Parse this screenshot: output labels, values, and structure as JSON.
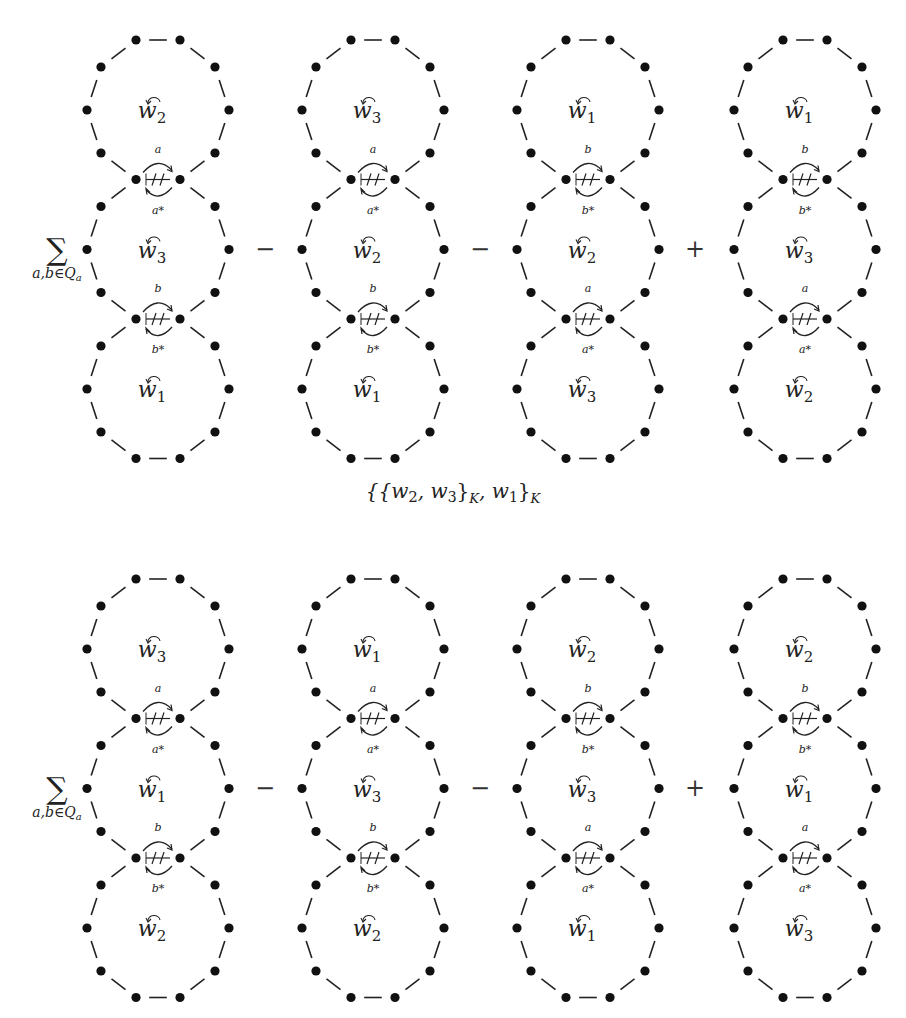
{
  "rows": [
    {
      "prefix": {
        "sum_symbol": "∑",
        "sum_subscript": "a,b∈Q",
        "sum_subscript_sub": "a"
      },
      "operators": [
        "−",
        "−",
        "+"
      ],
      "diagrams": [
        {
          "loops": [
            "2",
            "3",
            "1"
          ],
          "crossings": [
            {
              "top": "a",
              "bottom": "a*"
            },
            {
              "top": "b",
              "bottom": "b*"
            }
          ]
        },
        {
          "loops": [
            "3",
            "2",
            "1"
          ],
          "crossings": [
            {
              "top": "a",
              "bottom": "a*"
            },
            {
              "top": "b",
              "bottom": "b*"
            }
          ]
        },
        {
          "loops": [
            "1",
            "2",
            "3"
          ],
          "crossings": [
            {
              "top": "b",
              "bottom": "b*"
            },
            {
              "top": "a",
              "bottom": "a*"
            }
          ]
        },
        {
          "loops": [
            "1",
            "3",
            "2"
          ],
          "crossings": [
            {
              "top": "b",
              "bottom": "b*"
            },
            {
              "top": "a",
              "bottom": "a*"
            }
          ]
        }
      ]
    },
    {
      "prefix": {
        "sum_symbol": "∑",
        "sum_subscript": "a,b∈Q",
        "sum_subscript_sub": "a"
      },
      "operators": [
        "−",
        "−",
        "+"
      ],
      "diagrams": [
        {
          "loops": [
            "3",
            "1",
            "2"
          ],
          "crossings": [
            {
              "top": "a",
              "bottom": "a*"
            },
            {
              "top": "b",
              "bottom": "b*"
            }
          ]
        },
        {
          "loops": [
            "1",
            "3",
            "2"
          ],
          "crossings": [
            {
              "top": "a",
              "bottom": "a*"
            },
            {
              "top": "b",
              "bottom": "b*"
            }
          ]
        },
        {
          "loops": [
            "2",
            "3",
            "1"
          ],
          "crossings": [
            {
              "top": "b",
              "bottom": "b*"
            },
            {
              "top": "a",
              "bottom": "a*"
            }
          ]
        },
        {
          "loops": [
            "2",
            "1",
            "3"
          ],
          "crossings": [
            {
              "top": "b",
              "bottom": "b*"
            },
            {
              "top": "a",
              "bottom": "a*"
            }
          ]
        }
      ]
    }
  ],
  "loop_variable": "w",
  "crossing_mark": "⧺",
  "caption": "{{w2, w3}K, w1}K",
  "caption_parts": {
    "open": "{{",
    "w_a": "w",
    "a_sub": "2",
    "comma1": ", ",
    "w_b": "w",
    "b_sub": "3",
    "close1": "}",
    "k1": "K",
    "comma2": ", ",
    "w_c": "w",
    "c_sub": "1",
    "close2": "}",
    "k2": "K"
  }
}
